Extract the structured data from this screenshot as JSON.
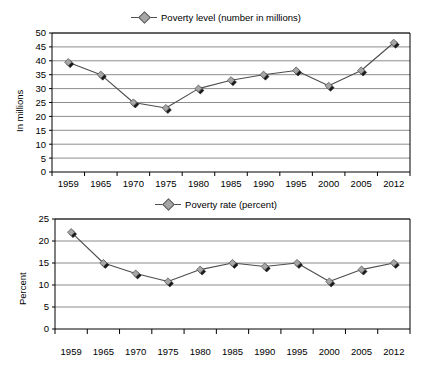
{
  "chart_data": [
    {
      "id": "poverty-level",
      "type": "line",
      "title": "",
      "legend": [
        "Poverty level (number in millions)"
      ],
      "legend_position": "top-center",
      "xlabel": "",
      "ylabel": "In millions",
      "categories": [
        "1959",
        "1965",
        "1970",
        "1975",
        "1980",
        "1985",
        "1990",
        "1995",
        "2000",
        "2005",
        "2012"
      ],
      "values": [
        39.5,
        35.0,
        25.0,
        23.0,
        30.0,
        33.0,
        35.0,
        36.5,
        31.0,
        36.5,
        46.5
      ],
      "ylim": [
        0,
        50
      ],
      "ytick_step": 5,
      "yticks": [
        "0",
        "5",
        "10",
        "15",
        "20",
        "25",
        "30",
        "35",
        "40",
        "45",
        "50"
      ],
      "grid": "horizontal",
      "marker": "diamond",
      "series_color": "#a6a6a6",
      "line_color": "#4d4d4d"
    },
    {
      "id": "poverty-rate",
      "type": "line",
      "title": "",
      "legend": [
        "Poverty rate (percent)"
      ],
      "legend_position": "top-center",
      "xlabel": "",
      "ylabel": "Percent",
      "categories": [
        "1959",
        "1965",
        "1970",
        "1975",
        "1980",
        "1985",
        "1990",
        "1995",
        "2000",
        "2005",
        "2012"
      ],
      "values": [
        22.0,
        15.0,
        12.6,
        10.8,
        13.5,
        15.0,
        14.2,
        15.0,
        10.8,
        13.5,
        15.0
      ],
      "ylim": [
        0,
        25
      ],
      "ytick_step": 5,
      "yticks": [
        "0",
        "5",
        "10",
        "15",
        "20",
        "25"
      ],
      "grid": "horizontal",
      "marker": "diamond",
      "series_color": "#a6a6a6",
      "line_color": "#4d4d4d"
    }
  ],
  "charts": {
    "top": {
      "legend_label": "Poverty level (number in millions)",
      "ylabel": "In millions"
    },
    "bottom": {
      "legend_label": "Poverty rate (percent)",
      "ylabel": "Percent"
    }
  }
}
